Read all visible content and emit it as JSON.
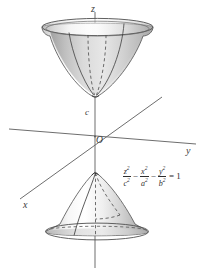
{
  "figure": {
    "axes": [
      {
        "id": "z",
        "label": "z",
        "name": "z-axis"
      },
      {
        "id": "y",
        "label": "y",
        "name": "y-axis"
      },
      {
        "id": "x",
        "label": "x",
        "name": "x-axis"
      }
    ],
    "points": [
      {
        "id": "origin",
        "label": "O"
      },
      {
        "id": "c",
        "label": "c"
      }
    ],
    "equation": {
      "term1_num": "z",
      "term1_num_exp": "2",
      "term1_den": "c",
      "term1_den_exp": "2",
      "op1": "−",
      "term2_num": "x",
      "term2_num_exp": "2",
      "term2_den": "a",
      "term2_den_exp": "2",
      "op2": "−",
      "term3_num": "y",
      "term3_num_exp": "2",
      "term3_den": "b",
      "term3_den_exp": "2",
      "equals": "= 1",
      "plain": "z²/c² − x²/a² − y²/b² = 1"
    },
    "colors": {
      "background": "#ffffff",
      "axis_line": "#6e6e6e",
      "outline": "#555555",
      "surface_light": "#ffffff",
      "surface_mid": "#d2d2d2",
      "surface_dark": "#8d8d8d",
      "label_text": "#3c3c3c",
      "equation_text": "#2e2e2e"
    }
  }
}
